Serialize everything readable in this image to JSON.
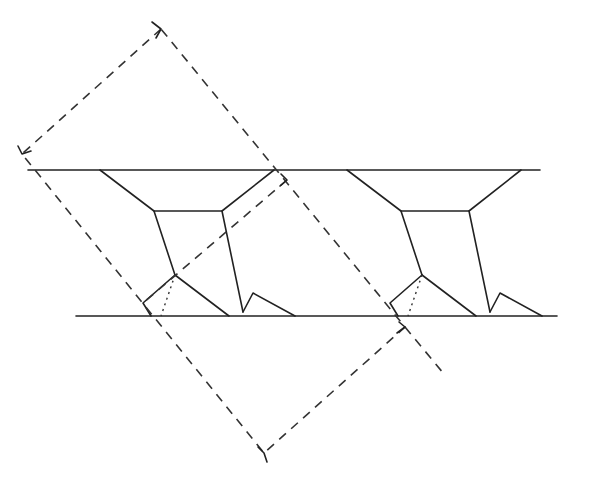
{
  "diagram": {
    "title": "",
    "colors": {
      "line": "#222222",
      "background": "#ffffff"
    },
    "rails": [
      {
        "name": "top-rail",
        "x1": 28,
        "y1": 170,
        "x2": 540,
        "y2": 170
      },
      {
        "name": "bottom-rail",
        "x1": 76,
        "y1": 316,
        "x2": 557,
        "y2": 316
      }
    ],
    "module_offset_x": 247,
    "module": {
      "trapezoid": "100,170 154,211 222,211 274,170",
      "left_leg": "154,211 175,275",
      "right_leg": "222,211 243,312",
      "foot_main": "175,275 229,316",
      "foot_back": "175,275 143,303 151,316",
      "foot_hidden": "175,275 161,316",
      "tooth": "243,312 253,293 295,316"
    },
    "dashed_outer_rect": "161,29 22,154 264,453 405,327",
    "dashed_corner_marks": [
      "152,22 161,29 156,38",
      "18,146 22,154 31,151",
      "258,447 264,453 267,462",
      "399,322 405,327 397,333"
    ],
    "dashed_inner_edge": "287,180 143,303",
    "dashed_inner_corner": "281,174 287,180 280,186",
    "dashed_extension": "405,327 444,374",
    "dashed_left_segment": "22,154 161,316 178,339"
  }
}
